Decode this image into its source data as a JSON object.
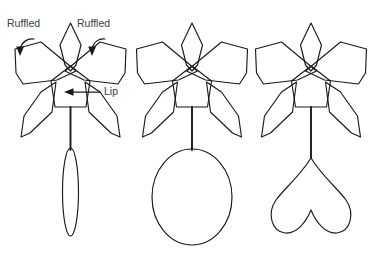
{
  "figure": {
    "background_color": "#ffffff",
    "line_color": "#1a1a1a",
    "text_color": "#3d3d3d"
  },
  "annotations": {
    "ruffled_left": "Ruffled",
    "ruffled_right": "Ruffled",
    "lip": "Lip"
  },
  "flowers": [
    {
      "id": "flower-1",
      "ovary_shape": "narrow-ellipse",
      "annotated": true
    },
    {
      "id": "flower-2",
      "ovary_shape": "wide-ellipse",
      "annotated": false
    },
    {
      "id": "flower-3",
      "ovary_shape": "bilobed-heart",
      "annotated": false
    }
  ]
}
